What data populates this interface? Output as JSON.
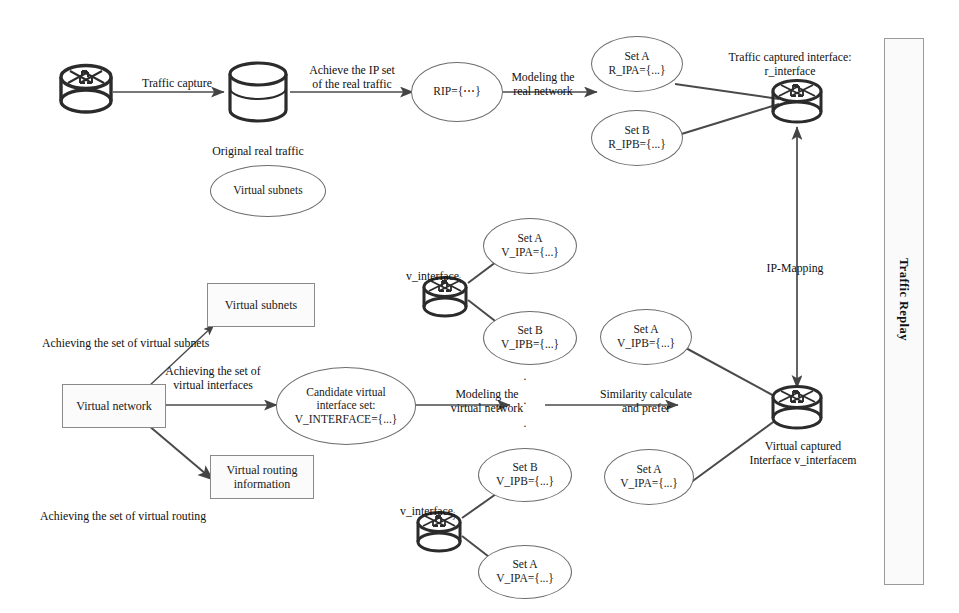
{
  "diagram": {
    "colors": {
      "stroke": "#555555",
      "ellipse_stroke": "#6d6d6d",
      "rect_stroke": "#8a8a8a",
      "router_stroke": "#2b2b2b",
      "text": "#111111",
      "background": "#ffffff"
    }
  },
  "real_flow": {
    "source_router_name": "real-network-router",
    "edge_traffic_capture": "Traffic capture",
    "database_label": "Original real traffic",
    "edge_achieve_ip_set": "Achieve the IP set\nof the real traffic",
    "rip_node": "RIP={⋯}",
    "edge_modeling_real": "Modeling the\nreal network",
    "set_a": {
      "line1": "Set A",
      "line2": "R_IPA={...}"
    },
    "set_b": {
      "line1": "Set B",
      "line2": "R_IPB={...}"
    },
    "captured_interface_label": "Traffic captured interface:\nr_interface"
  },
  "virtual_subnets_ellipse": "Virtual subnets",
  "virtual_flow": {
    "virtual_network_box": "Virtual network",
    "virtual_subnets_box": "Virtual subnets",
    "virtual_routing_box": "Virtual routing\ninformation",
    "caption_subnets": "Achieving the set of virtual subnets",
    "caption_interfaces": "Achieving the set of\nvirtual interfaces",
    "caption_routing": "Achieving the set of virtual routing",
    "candidate_set": "Candidate virtual\ninterface set:\nV_INTERFACE={...}",
    "edge_modeling_virtual": "Modeling the\nvirtual network",
    "edge_similarity": "Similarity calculate\nand prefer",
    "ellipsis": "·",
    "interface_top_label": "v_interface",
    "interface_top_sub": "i",
    "interface_bottom_label": "v_interface",
    "interface_bottom_sub": "j",
    "top_set_a": {
      "line1": "Set A",
      "line2": "V_IPA={...}"
    },
    "top_set_b": {
      "line1": "Set B",
      "line2": "V_IPB={...}"
    },
    "bottom_set_b": {
      "line1": "Set B",
      "line2": "V_IPB={...}"
    },
    "bottom_set_a": {
      "line1": "Set A",
      "line2": "V_IPA={...}"
    },
    "prefer_upper": {
      "line1": "Set A",
      "line2": "V_IPB={...}"
    },
    "prefer_lower": {
      "line1": "Set A",
      "line2": "V_IPA={...}"
    },
    "virtual_captured_label": "Virtual captured\nInterface v_interfacem"
  },
  "mapping": {
    "edge_ip_mapping": "IP-Mapping"
  },
  "sidebar": {
    "label": "Traffic Replay"
  }
}
